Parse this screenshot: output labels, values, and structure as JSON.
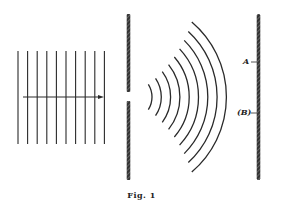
{
  "figure": {
    "caption": "Fig. 1",
    "plane_waves": {
      "count": 10,
      "x_start": 18,
      "spacing": 9.6,
      "y_top": 51,
      "y_bottom": 144
    },
    "arrow": {
      "x1": 23,
      "x2": 104,
      "y": 97
    },
    "barrier": {
      "x": 128.5,
      "y_top": 14,
      "gap_top": 92,
      "gap_bottom": 101,
      "y_bottom": 180
    },
    "circular_waves": {
      "count": 9,
      "center_x": 128,
      "center_y": 97,
      "first_radius": 24,
      "spacing": 9.3
    },
    "screen": {
      "x": 258.5,
      "y_top": 14,
      "y_bottom": 180
    },
    "labels": {
      "point_a": "A",
      "point_b": "(B)"
    },
    "colors": {
      "ink": "#2a2a2a",
      "background": "#ffffff"
    }
  }
}
